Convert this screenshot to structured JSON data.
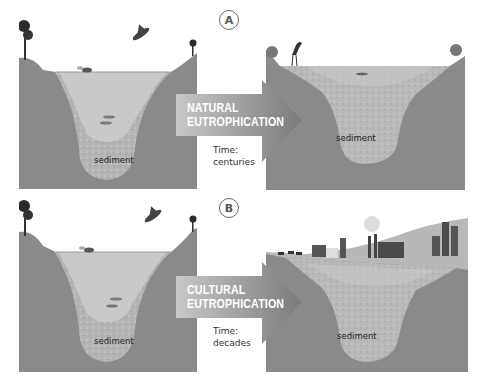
{
  "figure": {
    "rows": [
      {
        "id": "A",
        "badge": "A",
        "process_line1": "NATURAL",
        "process_line2": "EUTROPHICATION",
        "time_label": "Time:",
        "time_value": "centuries",
        "before_label": "sediment",
        "after_label": "sediment"
      },
      {
        "id": "B",
        "badge": "B",
        "process_line1": "CULTURAL",
        "process_line2": "EUTROPHICATION",
        "time_label": "Time:",
        "time_value": "decades",
        "before_label": "sediment",
        "after_label": "sediment"
      }
    ],
    "colors": {
      "ground": "#8a8a8a",
      "water": "#c9c9c9",
      "sediment": "#b3b3b3",
      "arrow_start": "#c8c8c8",
      "arrow_end": "#7a7a7a",
      "sky": "#ffffff"
    }
  }
}
